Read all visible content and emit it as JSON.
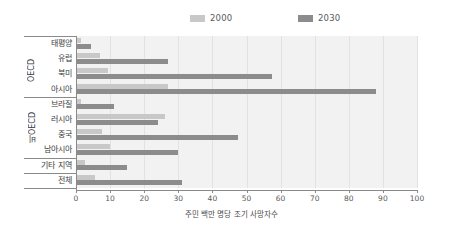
{
  "chart_data": {
    "type": "bar",
    "orientation": "horizontal",
    "title": "",
    "xlabel": "주민 백만 명당 조기 사망자수",
    "ylabel": "",
    "xlim": [
      0,
      100
    ],
    "xticks": [
      0,
      10,
      20,
      30,
      40,
      50,
      60,
      70,
      80,
      90,
      100
    ],
    "grid": true,
    "legend_position": "top",
    "categories": [
      "태평양",
      "유럽",
      "북미",
      "아시아",
      "브라질",
      "러시아",
      "중국",
      "남아시아",
      "기타 지역",
      "전체"
    ],
    "groups": [
      {
        "label": "OECD",
        "categories": [
          "태평양",
          "유럽",
          "북미",
          "아시아"
        ]
      },
      {
        "label": "비OECD",
        "categories": [
          "브라질",
          "러시아",
          "중국",
          "남아시아"
        ]
      },
      {
        "label": "",
        "categories": [
          "기타 지역"
        ]
      },
      {
        "label": "",
        "categories": [
          "전체"
        ]
      }
    ],
    "series": [
      {
        "name": "2000",
        "color": "#c8c8c8",
        "values": [
          1.5,
          7.0,
          9.5,
          27.0,
          1.5,
          26.0,
          7.5,
          10.0,
          2.5,
          5.5
        ]
      },
      {
        "name": "2030",
        "color": "#8c8c8c",
        "values": [
          4.5,
          27.0,
          57.5,
          88.0,
          11.0,
          24.0,
          47.5,
          30.0,
          15.0,
          31.0
        ]
      }
    ]
  },
  "legend": {
    "items": [
      {
        "label": "2000",
        "color": "#c8c8c8"
      },
      {
        "label": "2030",
        "color": "#8c8c8c"
      }
    ]
  },
  "axis": {
    "x_title": "주민 백만 명당 조기 사망자수",
    "x_tick_labels": [
      "0",
      "10",
      "20",
      "30",
      "40",
      "50",
      "60",
      "70",
      "80",
      "90",
      "100"
    ]
  },
  "category_labels": [
    "태평양",
    "유럽",
    "북미",
    "아시아",
    "브라질",
    "러시아",
    "중국",
    "남아시아",
    "기타 지역",
    "전체"
  ],
  "group_labels": [
    "OECD",
    "비OECD"
  ]
}
